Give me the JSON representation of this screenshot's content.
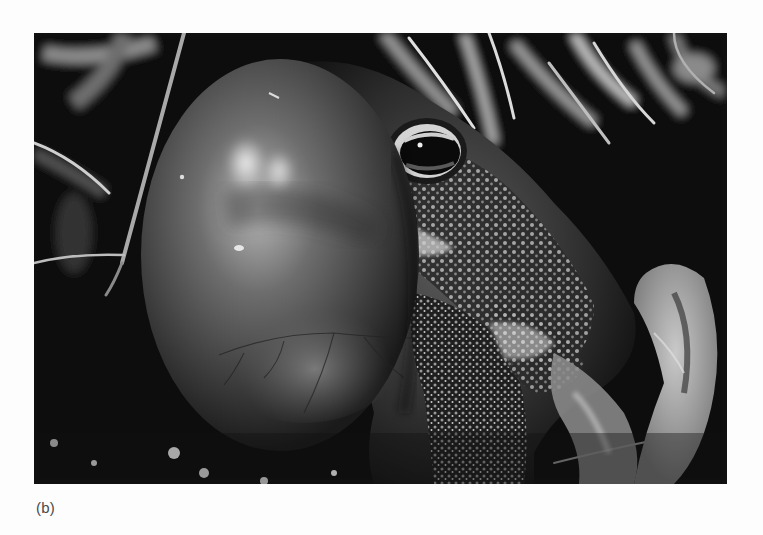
{
  "figure": {
    "panel_label": "(b)",
    "image": {
      "subject": "toad-with-inflated-vocal-sac",
      "style": "black-and-white photograph",
      "colors": {
        "background_page": "#fdfdfd",
        "photo_shadow": "#0b0b0b",
        "vocal_sac_mid": "#4a4a4a",
        "vocal_sac_highlight": "#d8d8d8",
        "skin_warts": "#bdbdbd",
        "caption_text": "#4a4a4a"
      }
    }
  }
}
